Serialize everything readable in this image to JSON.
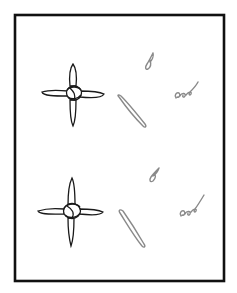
{
  "figure": {
    "colors": {
      "background": "#ffffff",
      "frame": "#111111",
      "knot_outline": "#1a1a1a",
      "loose_pieces": "#8a8a8a"
    },
    "panels": [
      {
        "id": "top",
        "elements": [
          {
            "type": "cross-knot",
            "label": "four-arm cross knot"
          },
          {
            "type": "loose-piece",
            "label": "small looped tab"
          },
          {
            "type": "loose-piece",
            "label": "elongated diagonal loop"
          },
          {
            "type": "loose-piece",
            "label": "curly squiggle"
          }
        ]
      },
      {
        "id": "bottom",
        "elements": [
          {
            "type": "cross-knot",
            "label": "four-arm cross knot"
          },
          {
            "type": "loose-piece",
            "label": "small looped tab"
          },
          {
            "type": "loose-piece",
            "label": "elongated diagonal loop"
          },
          {
            "type": "loose-piece",
            "label": "curly squiggle"
          }
        ]
      }
    ]
  }
}
